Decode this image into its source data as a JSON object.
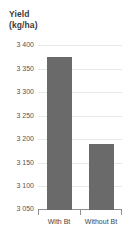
{
  "chart_data": {
    "type": "bar",
    "title": "Yield (kg/ha)",
    "title_lines": [
      "Yield",
      "(kg/ha)"
    ],
    "categories": [
      "With Bt",
      "Without Bt"
    ],
    "values": [
      3375,
      3190
    ],
    "xlabel": "",
    "ylabel": "Yield (kg/ha)",
    "ylim": [
      3050,
      3400
    ],
    "ytick_step": 50,
    "ytick_labels": [
      "3 400",
      "3 350",
      "3 300",
      "3 250",
      "3 200",
      "3 150",
      "3 100",
      "3 050"
    ],
    "ytick_values": [
      3400,
      3350,
      3300,
      3250,
      3200,
      3150,
      3100,
      3050
    ],
    "grid": true,
    "legend": false,
    "legend_position": "none",
    "series": [
      {
        "name": "Yield",
        "values": [
          3375,
          3190
        ]
      }
    ],
    "colors": {
      "bar": "#6a6a6a",
      "gridline": "#e8e8e8",
      "axis": "#8f8f8f",
      "title_text": "#3c3c3c",
      "tick_text": "#555555",
      "category_text": "#444444",
      "background": "#ffffff"
    }
  }
}
